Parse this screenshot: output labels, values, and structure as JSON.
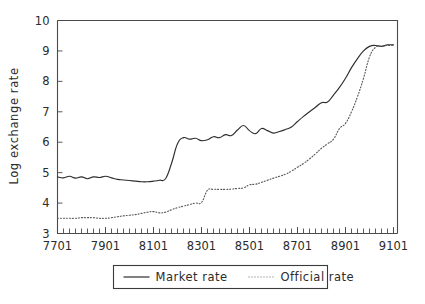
{
  "chart_data": {
    "type": "line",
    "title": "",
    "xlabel": "",
    "ylabel": "Log exchange rate",
    "xlim": [
      7701,
      9103
    ],
    "ylim": [
      3,
      10
    ],
    "yticks": [
      3,
      4,
      5,
      6,
      7,
      8,
      9,
      10
    ],
    "ytick_labels": [
      "3",
      "4",
      "5",
      "6",
      "7",
      "8",
      "9",
      "10"
    ],
    "xticks": [
      7701,
      7901,
      8101,
      8301,
      8501,
      8701,
      8901,
      9101
    ],
    "xtick_labels": [
      "7701",
      "7901",
      "8101",
      "8301",
      "8501",
      "8701",
      "8901",
      "9101"
    ],
    "grid": false,
    "legend_position": "below-center",
    "minor_ticks": true,
    "x_minor_interval_months": 3,
    "series": [
      {
        "name": "Market rate",
        "style": "solid",
        "color": "#2e2e2e",
        "x": [
          7701,
          7704,
          7707,
          7710,
          7801,
          7804,
          7807,
          7810,
          7901,
          7904,
          7907,
          7910,
          8001,
          8004,
          8007,
          8010,
          8101,
          8104,
          8107,
          8110,
          8201,
          8204,
          8207,
          8210,
          8301,
          8304,
          8307,
          8310,
          8401,
          8404,
          8407,
          8410,
          8501,
          8504,
          8507,
          8510,
          8601,
          8604,
          8607,
          8610,
          8701,
          8704,
          8707,
          8710,
          8801,
          8804,
          8807,
          8810,
          8901,
          8904,
          8907,
          8910,
          9001,
          9004,
          9007,
          9010,
          9101
        ],
        "values": [
          4.86,
          4.83,
          4.88,
          4.82,
          4.86,
          4.8,
          4.86,
          4.84,
          4.88,
          4.83,
          4.78,
          4.76,
          4.74,
          4.72,
          4.7,
          4.7,
          4.72,
          4.75,
          4.8,
          5.3,
          5.95,
          6.15,
          6.1,
          6.13,
          6.05,
          6.08,
          6.18,
          6.15,
          6.25,
          6.22,
          6.4,
          6.55,
          6.38,
          6.28,
          6.45,
          6.38,
          6.3,
          6.35,
          6.42,
          6.5,
          6.68,
          6.85,
          7.0,
          7.15,
          7.3,
          7.32,
          7.55,
          7.8,
          8.1,
          8.45,
          8.75,
          9.0,
          9.15,
          9.18,
          9.15,
          9.2,
          9.2
        ]
      },
      {
        "name": "Official rate",
        "style": "dotted",
        "color": "#5a5a5a",
        "x": [
          7701,
          7704,
          7707,
          7710,
          7801,
          7804,
          7807,
          7810,
          7901,
          7904,
          7907,
          7910,
          8001,
          8004,
          8007,
          8010,
          8101,
          8104,
          8107,
          8110,
          8201,
          8204,
          8207,
          8210,
          8301,
          8304,
          8307,
          8310,
          8401,
          8404,
          8407,
          8410,
          8501,
          8504,
          8507,
          8510,
          8601,
          8604,
          8607,
          8610,
          8701,
          8704,
          8707,
          8710,
          8801,
          8804,
          8807,
          8810,
          8901,
          8904,
          8907,
          8910,
          9001,
          9004,
          9007,
          9010,
          9101
        ],
        "values": [
          3.5,
          3.5,
          3.5,
          3.5,
          3.52,
          3.52,
          3.52,
          3.5,
          3.5,
          3.52,
          3.55,
          3.58,
          3.6,
          3.62,
          3.66,
          3.7,
          3.72,
          3.68,
          3.7,
          3.78,
          3.85,
          3.9,
          3.95,
          4.0,
          4.02,
          4.42,
          4.45,
          4.45,
          4.45,
          4.46,
          4.48,
          4.5,
          4.6,
          4.62,
          4.68,
          4.75,
          4.82,
          4.88,
          4.95,
          5.05,
          5.18,
          5.3,
          5.45,
          5.62,
          5.8,
          5.95,
          6.1,
          6.45,
          6.62,
          7.0,
          7.5,
          8.1,
          8.8,
          9.12,
          9.15,
          9.18,
          9.18
        ]
      }
    ],
    "legend": [
      {
        "label": "Market rate",
        "style": "solid"
      },
      {
        "label": "Official rate",
        "style": "dotted"
      }
    ]
  }
}
